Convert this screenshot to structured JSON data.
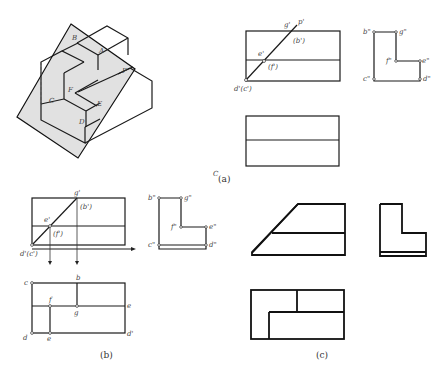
{
  "figure": {
    "captions": {
      "a": "(a)",
      "b": "(b)",
      "c": "(c)"
    },
    "panel_a": {
      "iso_labels": [
        "B",
        "A",
        "P",
        "F",
        "E",
        "C",
        "D"
      ],
      "front_view_labels": {
        "g": "g'",
        "p": "p'",
        "b": "(b')",
        "e": "e'",
        "f": "(f')",
        "d": "d'(c')"
      },
      "side_view_labels": {
        "b": "b\"",
        "g": "g\"",
        "f": "f\"",
        "e": "e\"",
        "c": "c\"",
        "d": "d\""
      }
    },
    "panel_b": {
      "front_view_labels": {
        "g": "g'",
        "b": "(b')",
        "e": "e'",
        "f": "(f')",
        "d": "d'(c')"
      },
      "side_view_labels": {
        "b": "b\"",
        "g": "g\"",
        "f": "f\"",
        "e": "e\"",
        "c": "c\"",
        "d": "d\""
      },
      "top_view_labels": {
        "c": "c",
        "b": "b",
        "f": "f",
        "g": "g",
        "e_right": "e",
        "d": "d",
        "e": "e",
        "d_right": "d'"
      }
    },
    "misc_mark": "С"
  }
}
